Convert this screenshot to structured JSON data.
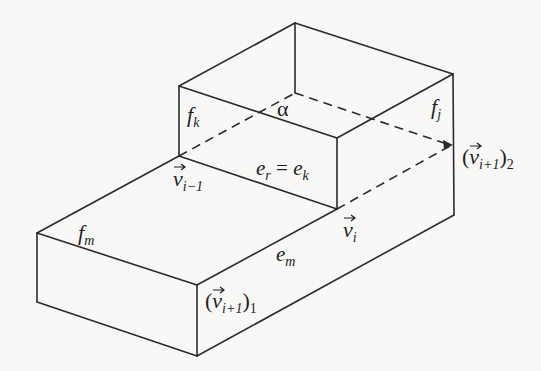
{
  "figure": {
    "colors": {
      "line": "#2b2b2b",
      "text": "#1e1e1e",
      "background": "#f8f8f6"
    }
  },
  "labels": {
    "face_k": {
      "base": "f",
      "sub": "k"
    },
    "face_j": {
      "base": "f",
      "sub": "j"
    },
    "face_m": {
      "base": "f",
      "sub": "m"
    },
    "alpha": "α",
    "edge_r_eq_k": {
      "base1": "e",
      "sub1": "r",
      "eq": " = ",
      "base2": "e",
      "sub2": "k"
    },
    "edge_m": {
      "base": "e",
      "sub": "m"
    },
    "vertex_i_minus_1": {
      "base": "v",
      "sub": "i−1"
    },
    "vertex_i": {
      "base": "v",
      "sub": "i"
    },
    "vertex_i_plus_1_1": {
      "open": "(",
      "base": "v",
      "sub": "i+1",
      "close": ")",
      "outer_sub": "1"
    },
    "vertex_i_plus_1_2": {
      "open": "(",
      "base": "v",
      "sub": "i+1",
      "close": ")",
      "outer_sub": "2"
    }
  }
}
